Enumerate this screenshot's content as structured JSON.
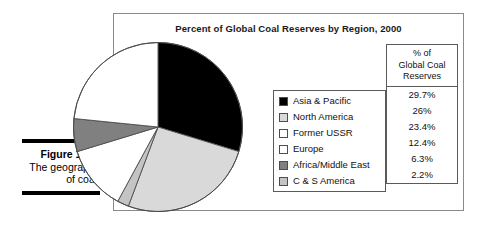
{
  "caption": {
    "label": "Figure 16-3:",
    "description": "The geography of coal."
  },
  "figure": {
    "title": "Percent of Global Coal Reserves by Region, 2000"
  },
  "table": {
    "header_lines": [
      "% of",
      "Global Coal",
      "Reserves"
    ]
  },
  "colors": {
    "asia_pacific": "#000000",
    "north_america": "#d9d9d9",
    "former_ussr": "#ffffff",
    "europe": "#ffffff",
    "africa_middle_east": "#808080",
    "c_s_america": "#c4c4c4",
    "outline": "#4d4d4d",
    "frame": "#8a8a8a",
    "rule": "#000000"
  },
  "chart_data": {
    "type": "pie",
    "title": "Percent of Global Coal Reserves by Region, 2000",
    "xlabel": "",
    "ylabel": "",
    "legend_position": "right",
    "grid": false,
    "value_suffix": "%",
    "labels": [
      "Asia & Pacific",
      "North America",
      "Former USSR",
      "Europe",
      "Africa/Middle East",
      "C & S America"
    ],
    "values": [
      29.7,
      26,
      23.4,
      12.4,
      6.3,
      2.2
    ],
    "value_labels": [
      "29.7%",
      "26%",
      "23.4%",
      "12.4%",
      "6.3%",
      "2.2%"
    ],
    "slice_colors": [
      "#000000",
      "#d9d9d9",
      "#ffffff",
      "#ffffff",
      "#808080",
      "#c4c4c4"
    ],
    "draw_order_clockwise_from_top": [
      "Asia & Pacific",
      "North America",
      "C & S America",
      "Europe",
      "Africa/Middle East",
      "Former USSR"
    ],
    "slices": [
      {
        "label": "Asia & Pacific",
        "value": 29.7,
        "value_label": "29.7%",
        "color": "#000000"
      },
      {
        "label": "North America",
        "value": 26,
        "value_label": "26%",
        "color": "#d9d9d9"
      },
      {
        "label": "Former USSR",
        "value": 23.4,
        "value_label": "23.4%",
        "color": "#ffffff"
      },
      {
        "label": "Europe",
        "value": 12.4,
        "value_label": "12.4%",
        "color": "#ffffff"
      },
      {
        "label": "Africa/Middle East",
        "value": 6.3,
        "value_label": "6.3%",
        "color": "#808080"
      },
      {
        "label": "C & S America",
        "value": 2.2,
        "value_label": "2.2%",
        "color": "#c4c4c4"
      }
    ]
  }
}
